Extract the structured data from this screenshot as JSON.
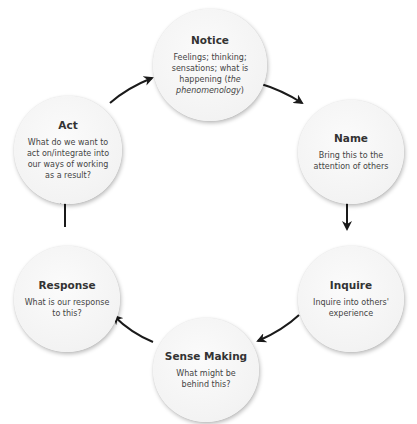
{
  "diagram": {
    "type": "cycle",
    "nodes": [
      {
        "id": "notice",
        "title": "Notice",
        "desc": "Feelings; thinking; sensations; what is happening (",
        "desc_italic": "the phenomenology",
        "desc_tail": ")"
      },
      {
        "id": "name",
        "title": "Name",
        "desc": "Bring this to the attention of others"
      },
      {
        "id": "inquire",
        "title": "Inquire",
        "desc": "Inquire into others' experience"
      },
      {
        "id": "sense-making",
        "title": "Sense Making",
        "desc": "What might be behind this?"
      },
      {
        "id": "response",
        "title": "Response",
        "desc": "What is our response to this?"
      },
      {
        "id": "act",
        "title": "Act",
        "desc": "What do we want to act on/integrate into our ways of working as a result?"
      }
    ],
    "edges": [
      {
        "from": "notice",
        "to": "name"
      },
      {
        "from": "name",
        "to": "inquire"
      },
      {
        "from": "inquire",
        "to": "sense-making"
      },
      {
        "from": "sense-making",
        "to": "response"
      },
      {
        "from": "response",
        "to": "act"
      },
      {
        "from": "act",
        "to": "notice"
      }
    ],
    "colors": {
      "node_fill": "#f5f5f5",
      "arrow": "#1a1a1a",
      "title_text": "#333333",
      "body_text": "#444444"
    }
  }
}
